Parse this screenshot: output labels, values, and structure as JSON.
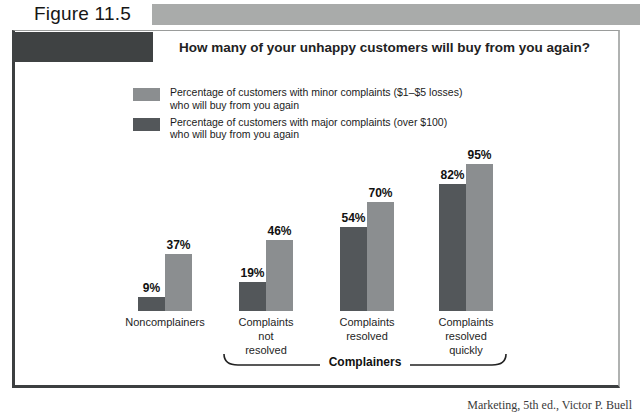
{
  "figure": {
    "label": "Figure 11.5"
  },
  "chart_data": {
    "type": "bar",
    "title": "How many of your unhappy customers will buy from you again?",
    "categories": [
      "Noncomplainers",
      "Complaints\nnot\nresolved",
      "Complaints\nresolved",
      "Complaints\nresolved\nquickly"
    ],
    "series": [
      {
        "name": "minor complaints",
        "legend_line1": "Percentage of customers with minor complaints ($1–$5 losses)",
        "legend_line2": "who will buy from you again",
        "color": "#8b8e90",
        "values": [
          37,
          46,
          70,
          95
        ],
        "labels": [
          "37%",
          "46%",
          "70%",
          "95%"
        ]
      },
      {
        "name": "major complaints",
        "legend_line1": "Percentage of customers with major complaints (over $100)",
        "legend_line2": "who will buy from you again",
        "color": "#53575a",
        "values": [
          9,
          19,
          54,
          82
        ],
        "labels": [
          "9%",
          "19%",
          "54%",
          "82%"
        ]
      }
    ],
    "unit": "%",
    "ylim": [
      0,
      100
    ],
    "grid": false,
    "legend_position": "top-left",
    "bracket_label": "Complainers",
    "bracket_covers": [
      "Complaints not resolved",
      "Complaints resolved",
      "Complaints resolved quickly"
    ]
  },
  "caption": {
    "partial_text": "Marketing, 5th ed.,  Victor P. Buell"
  },
  "colors": {
    "banner_dark": "#3f4243",
    "banner_light": "#a9abaa",
    "frame_dark": "#3c3f40"
  }
}
